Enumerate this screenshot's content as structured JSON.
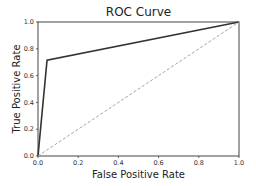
{
  "chart_data": {
    "type": "line",
    "title": "ROC Curve",
    "xlabel": "False Positive Rate",
    "ylabel": "True Positive Rate",
    "xlim": [
      0.0,
      1.0
    ],
    "ylim": [
      0.0,
      1.0
    ],
    "xticks": [
      "0.0",
      "0.2",
      "0.4",
      "0.6",
      "0.8",
      "1.0"
    ],
    "yticks": [
      "0.0",
      "0.2",
      "0.4",
      "0.6",
      "0.8",
      "1.0"
    ],
    "grid": false,
    "legend": null,
    "series": [
      {
        "name": "ROC",
        "style": "solid",
        "color": "#333333",
        "x": [
          0.0,
          0.045,
          1.0
        ],
        "y": [
          0.0,
          0.715,
          1.0
        ]
      },
      {
        "name": "chance",
        "style": "dashed",
        "color": "#999999",
        "x": [
          0.0,
          1.0
        ],
        "y": [
          0.0,
          1.0
        ]
      }
    ]
  }
}
